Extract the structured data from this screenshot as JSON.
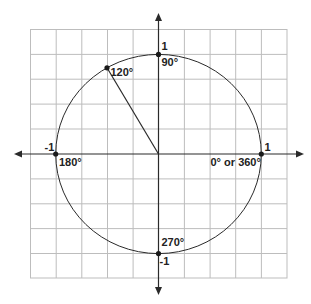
{
  "diagram": {
    "type": "unit-circle",
    "colors": {
      "background": "#ffffff",
      "grid": "#bdbdbd",
      "stroke": "#2a2a2a",
      "text": "#222222"
    },
    "grid": {
      "columns": 10,
      "rows": 10
    },
    "axis_labels": {
      "top": "1",
      "bottom": "-1",
      "left": "-1",
      "right": "1"
    },
    "angle_labels": {
      "a0": "0° or 360°",
      "a90": "90°",
      "a120": "120°",
      "a180": "180°",
      "a270": "270°"
    },
    "points": [
      {
        "name": "point-0-degrees",
        "angle": 0,
        "x": 1,
        "y": 0
      },
      {
        "name": "point-90-degrees",
        "angle": 90,
        "x": 0,
        "y": 1
      },
      {
        "name": "point-120-degrees",
        "angle": 120,
        "x": -0.5,
        "y": 0.866
      },
      {
        "name": "point-180-degrees",
        "angle": 180,
        "x": -1,
        "y": 0
      },
      {
        "name": "point-270-degrees",
        "angle": 270,
        "x": 0,
        "y": -1
      }
    ],
    "radius_segment": {
      "from_angle": 0,
      "to_angle": 120,
      "description": "radius drawn from origin to 120° point"
    }
  }
}
